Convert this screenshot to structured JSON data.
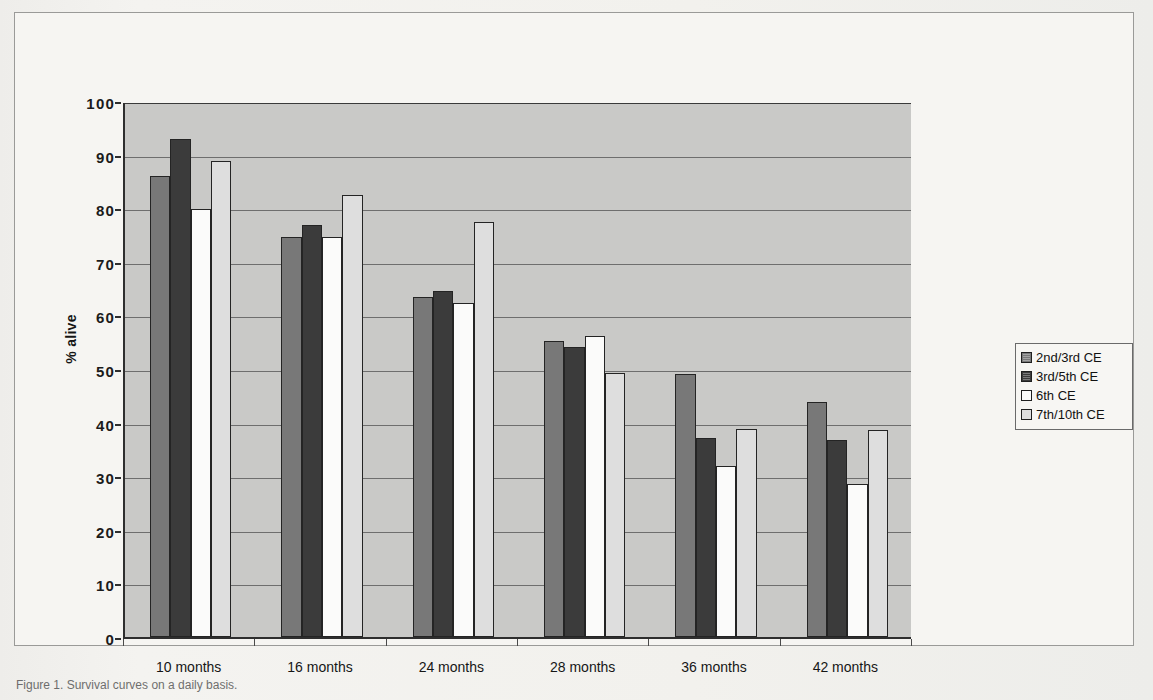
{
  "chart_data": {
    "type": "bar",
    "title": "",
    "xlabel": "",
    "ylabel": "% alive",
    "ylim": [
      0,
      100
    ],
    "ytick_step": 10,
    "yticks": [
      "100",
      "90",
      "80",
      "70",
      "60",
      "50",
      "40",
      "30",
      "20",
      "10",
      "0"
    ],
    "grid": true,
    "legend_position": "right",
    "categories": [
      "10 months",
      "16 months",
      "24 months",
      "28 months",
      "36 months",
      "42 months"
    ],
    "series": [
      {
        "name": "2nd/3rd CE",
        "color": "#787878",
        "values": [
          86.0,
          74.6,
          63.4,
          55.3,
          49.0,
          43.9
        ]
      },
      {
        "name": "3rd/5th CE",
        "color": "#3b3b3b",
        "values": [
          93.0,
          76.8,
          64.5,
          54.2,
          37.1,
          36.8
        ]
      },
      {
        "name": "6th CE",
        "color": "#fbfbfa",
        "values": [
          79.9,
          74.6,
          62.4,
          56.1,
          31.9,
          28.6
        ]
      },
      {
        "name": "7th/10th CE",
        "color": "#dedede",
        "values": [
          88.9,
          82.4,
          77.4,
          49.2,
          38.9,
          38.6
        ]
      }
    ]
  },
  "legend": {
    "items": [
      {
        "label": "2nd/3rd CE",
        "swatch": "legend-swatch-medium-gray"
      },
      {
        "label": "3rd/5th CE",
        "swatch": "legend-swatch-dark-gray"
      },
      {
        "label": "6th CE",
        "swatch": "legend-swatch-white"
      },
      {
        "label": "7th/10th CE",
        "swatch": "legend-swatch-light-gray"
      }
    ]
  },
  "caption": {
    "text": "Figure 1. Survival curves on a daily basis."
  },
  "colors": {
    "plot_background": "#c9c9c7",
    "page_background": "#f2f1ee",
    "axis": "#2e2e2e",
    "gridline": "#6e6e6e",
    "bar_outline": "#242424"
  }
}
